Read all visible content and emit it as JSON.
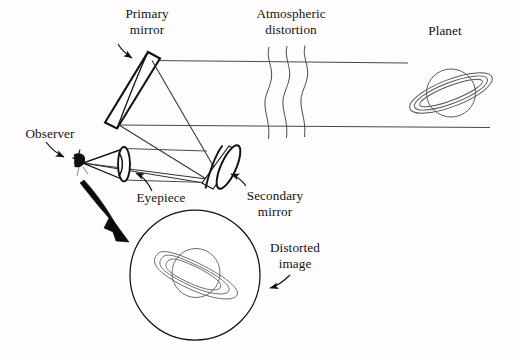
{
  "figure": {
    "kind": "optical-diagram",
    "background_color": "#fffdfd",
    "ink_color": "#111111",
    "ray_color": "#4a4a4a"
  },
  "labels": {
    "primary_mirror": "Primary\nmirror",
    "atmospheric_distortion": "Atmospheric\ndistortion",
    "planet": "Planet",
    "observer": "Observer",
    "eyepiece": "Eyepiece",
    "secondary_mirror": "Secondary\nmirror",
    "distorted_image": "Distorted\nimage"
  },
  "parts": [
    {
      "id": "primary-mirror",
      "label": "Primary mirror",
      "shape": "tilted-thick-bar"
    },
    {
      "id": "secondary-mirror",
      "label": "Secondary mirror",
      "shape": "tilted-oval-disc"
    },
    {
      "id": "eyepiece",
      "label": "Eyepiece",
      "shape": "lens-in-tube"
    },
    {
      "id": "observer",
      "label": "Observer",
      "shape": "eye-glyph"
    },
    {
      "id": "planet",
      "label": "Planet",
      "shape": "ringed-planet"
    },
    {
      "id": "distorted-image",
      "label": "Distorted image",
      "shape": "circular-view-field"
    },
    {
      "id": "atmospheric-distortion",
      "label": "Atmospheric distortion",
      "shape": "wavy-lines",
      "count": 3
    }
  ],
  "icons": {
    "planet": "ringed-planet-icon",
    "distorted_planet": "distorted-ringed-planet-icon",
    "observer": "observer-eye-icon",
    "wavy_line": "wavy-line-icon",
    "callout_arrow": "curved-callout-arrow-icon",
    "magnify_arrow": "thick-curved-arrow-icon"
  }
}
